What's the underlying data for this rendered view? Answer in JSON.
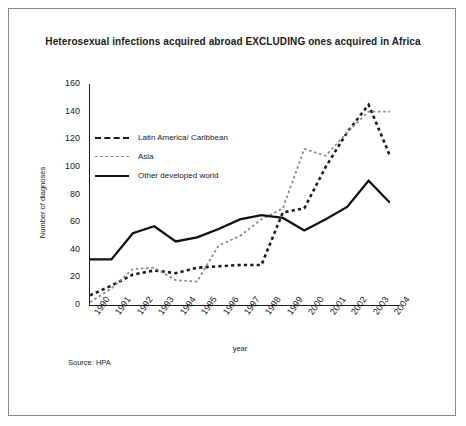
{
  "figure": {
    "title": "Heterosexual infections acquired abroad EXCLUDING ones acquired in Africa",
    "source": "Source: HPA",
    "frame_color": "#8a8a8a",
    "background": "#ffffff"
  },
  "legend": {
    "position": "upper-left-inside",
    "items": [
      {
        "label": "Latin America/ Caribbean",
        "style": "bold-dashed",
        "color": "#1a1a1a",
        "key": "k-dash"
      },
      {
        "label": "Asia",
        "style": "light-dotted",
        "color": "#8c8c8c",
        "key": "k-dot"
      },
      {
        "label": "Other developed world",
        "style": "solid",
        "color": "#111111",
        "key": "k-solid"
      }
    ]
  },
  "chart_data": {
    "type": "line",
    "title": "Heterosexual infections acquired abroad EXCLUDING ones acquired in Africa",
    "xlabel": "year",
    "ylabel": "Number of diagnoses",
    "categories": [
      "1990",
      "1991",
      "1992",
      "1993",
      "1994",
      "1995",
      "1996",
      "1997",
      "1998",
      "1999",
      "2000",
      "2001",
      "2002",
      "2003",
      "2004"
    ],
    "x": [
      1990,
      1991,
      1992,
      1993,
      1994,
      1995,
      1996,
      1997,
      1998,
      1999,
      2000,
      2001,
      2002,
      2003,
      2004
    ],
    "ylim": [
      0,
      160
    ],
    "yticks": [
      0,
      20,
      40,
      60,
      80,
      100,
      120,
      140,
      160
    ],
    "grid": false,
    "legend_position": "upper left",
    "series": [
      {
        "name": "Latin America/ Caribbean",
        "color": "#1a1a1a",
        "style": "bold-dashed",
        "values": [
          7,
          14,
          22,
          25,
          23,
          27,
          28,
          29,
          29,
          67,
          70,
          100,
          125,
          145,
          108
        ]
      },
      {
        "name": "Asia",
        "color": "#8c8c8c",
        "style": "light-dotted",
        "values": [
          2,
          12,
          26,
          27,
          18,
          17,
          43,
          50,
          62,
          70,
          113,
          108,
          125,
          140,
          140
        ]
      },
      {
        "name": "Other developed world",
        "color": "#111111",
        "style": "solid",
        "values": [
          33,
          33,
          52,
          57,
          46,
          49,
          55,
          62,
          65,
          63,
          54,
          62,
          71,
          90,
          74
        ]
      }
    ]
  }
}
